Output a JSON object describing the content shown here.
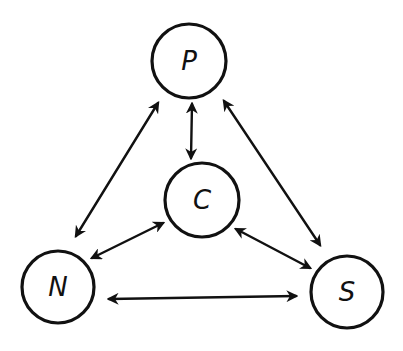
{
  "diagram": {
    "type": "relationship-graph",
    "background": "#ffffff",
    "stroke_color": "#111111",
    "nodes": [
      {
        "id": "P",
        "label": "P",
        "cx": 189,
        "cy": 61,
        "r": 37
      },
      {
        "id": "C",
        "label": "C",
        "cx": 202,
        "cy": 200,
        "r": 37
      },
      {
        "id": "N",
        "label": "N",
        "cx": 58,
        "cy": 287,
        "r": 36
      },
      {
        "id": "S",
        "label": "S",
        "cx": 347,
        "cy": 292,
        "r": 36
      }
    ],
    "edges": [
      {
        "from": "P",
        "to": "C",
        "bidirectional": true,
        "x1": 192,
        "y1": 104,
        "x2": 191,
        "y2": 158
      },
      {
        "from": "P",
        "to": "N",
        "bidirectional": true,
        "x1": 158,
        "y1": 103,
        "x2": 76,
        "y2": 236
      },
      {
        "from": "P",
        "to": "S",
        "bidirectional": true,
        "x1": 224,
        "y1": 101,
        "x2": 320,
        "y2": 245
      },
      {
        "from": "C",
        "to": "N",
        "bidirectional": true,
        "x1": 163,
        "y1": 223,
        "x2": 92,
        "y2": 258
      },
      {
        "from": "C",
        "to": "S",
        "bidirectional": true,
        "x1": 236,
        "y1": 229,
        "x2": 310,
        "y2": 268
      },
      {
        "from": "N",
        "to": "S",
        "bidirectional": true,
        "x1": 109,
        "y1": 299,
        "x2": 296,
        "y2": 296
      }
    ]
  }
}
